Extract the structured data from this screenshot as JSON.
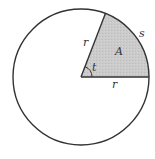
{
  "diagram": {
    "type": "circle-sector",
    "center": [
      81,
      77
    ],
    "radius": 68,
    "sector_start_angle_deg": 0,
    "sector_end_angle_deg": 69,
    "colors": {
      "stroke": "#333333",
      "sector_fill": "#c9c9c9",
      "background": "#ffffff"
    },
    "labels": {
      "radius_slanted": "r",
      "radius_horizontal": "r",
      "area": "A",
      "arc_length": "s",
      "angle": "t"
    }
  }
}
